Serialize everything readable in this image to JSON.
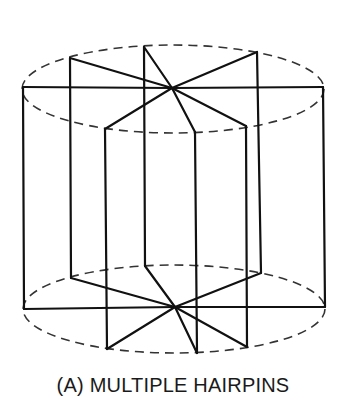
{
  "figure": {
    "caption": "(A) MULTIPLE HAIRPINS",
    "stroke_color": "#111111",
    "dash_color": "#333333",
    "top_ellipse": {
      "cx": 173,
      "cy": 89,
      "rx": 151,
      "ry": 44
    },
    "bottom_ellipse": {
      "cx": 174,
      "cy": 309,
      "rx": 151,
      "ry": 44
    },
    "top_center": [
      172,
      88
    ],
    "bottom_center": [
      175,
      307
    ],
    "verticals": [
      {
        "top": [
          23,
          87
        ],
        "bottom": [
          24,
          309
        ]
      },
      {
        "top": [
          70,
          58
        ],
        "bottom": [
          71,
          278
        ]
      },
      {
        "top": [
          105,
          129
        ],
        "bottom": [
          107,
          349
        ]
      },
      {
        "top": [
          144,
          47
        ],
        "bottom": [
          145,
          266
        ]
      },
      {
        "top": [
          195,
          132
        ],
        "bottom": [
          197,
          353
        ]
      },
      {
        "top": [
          246,
          126
        ],
        "bottom": [
          247,
          347
        ]
      },
      {
        "top": [
          257,
          52
        ],
        "bottom": [
          261,
          273
        ]
      },
      {
        "top": [
          323,
          87
        ],
        "bottom": [
          325,
          307
        ]
      }
    ]
  }
}
